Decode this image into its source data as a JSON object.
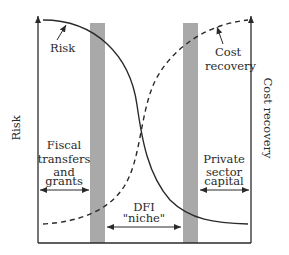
{
  "diagram": {
    "type": "conceptual-curves",
    "left_axis_label": "Risk",
    "right_axis_label": "Cost recovery",
    "curves": [
      {
        "name": "Risk",
        "style": "solid",
        "direction": "decreasing from left to right"
      },
      {
        "name": "Cost recovery",
        "style": "dashed",
        "direction": "increasing from left to right"
      }
    ],
    "annotations": {
      "risk": "Risk",
      "cost_recovery_line1": "Cost",
      "cost_recovery_line2": "recovery",
      "fiscal_line1": "Fiscal",
      "fiscal_line2": "transfers",
      "fiscal_line3": "and",
      "fiscal_line4": "grants",
      "private_line1": "Private",
      "private_line2": "sector",
      "private_line3": "capital",
      "dfi_line1": "DFI",
      "dfi_line2": "\"niche\""
    },
    "regions": [
      {
        "label": "Fiscal transfers and grants",
        "position": "left"
      },
      {
        "label": "DFI \"niche\"",
        "position": "middle"
      },
      {
        "label": "Private sector capital",
        "position": "right"
      }
    ],
    "colors": {
      "line": "#2a2a2a",
      "band": "#a9a9a9",
      "background": "#ffffff"
    }
  }
}
